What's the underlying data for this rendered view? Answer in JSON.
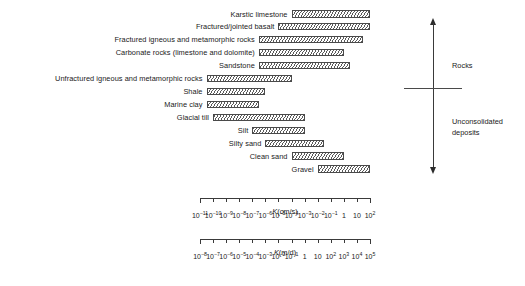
{
  "chart_data": {
    "type": "bar",
    "orientation": "horizontal",
    "scale": "log",
    "xlabel": "K (cm/s)",
    "xlabel_secondary": "K (m/d)",
    "ylabel": "",
    "grid": false,
    "legend": false,
    "axes": [
      {
        "name": "K (cm/s)",
        "unit": "cm/s",
        "exponent_min": -11,
        "exponent_max": 2,
        "ticks": [
          "10-11",
          "10-10",
          "10-9",
          "10-8",
          "10-7",
          "10-6",
          "10-5",
          "10-4",
          "10-3",
          "10-2",
          "10-1",
          "1",
          "10",
          "10 2"
        ],
        "tick_labels": [
          {
            "mantissa": "10",
            "exponent": "−11"
          },
          {
            "mantissa": "10",
            "exponent": "−10"
          },
          {
            "mantissa": "10",
            "exponent": "−9"
          },
          {
            "mantissa": "10",
            "exponent": "−8"
          },
          {
            "mantissa": "10",
            "exponent": "−7"
          },
          {
            "mantissa": "10",
            "exponent": "−6"
          },
          {
            "mantissa": "10",
            "exponent": "−5"
          },
          {
            "mantissa": "10",
            "exponent": "−4"
          },
          {
            "mantissa": "10",
            "exponent": "−3"
          },
          {
            "mantissa": "10",
            "exponent": "−2"
          },
          {
            "mantissa": "10",
            "exponent": "−1"
          },
          {
            "mantissa": "1",
            "exponent": ""
          },
          {
            "mantissa": "10",
            "exponent": ""
          },
          {
            "mantissa": "10",
            "exponent": "2"
          }
        ]
      },
      {
        "name": "K (m/d)",
        "unit": "m/d",
        "exponent_min": -8,
        "exponent_max": 5,
        "ticks": [
          "10-8",
          "10-7",
          "10-6",
          "10-5",
          "10-4",
          "10-3",
          "10-2",
          "10-1",
          "1",
          "10",
          "10 2",
          "10 3",
          "10 4",
          "10 5"
        ],
        "tick_labels": [
          {
            "mantissa": "10",
            "exponent": "−8"
          },
          {
            "mantissa": "10",
            "exponent": "−7"
          },
          {
            "mantissa": "10",
            "exponent": "−6"
          },
          {
            "mantissa": "10",
            "exponent": "−5"
          },
          {
            "mantissa": "10",
            "exponent": "−4"
          },
          {
            "mantissa": "10",
            "exponent": "−3"
          },
          {
            "mantissa": "10",
            "exponent": "−2"
          },
          {
            "mantissa": "10",
            "exponent": "−1"
          },
          {
            "mantissa": "1",
            "exponent": ""
          },
          {
            "mantissa": "10",
            "exponent": ""
          },
          {
            "mantissa": "10",
            "exponent": "2"
          },
          {
            "mantissa": "10",
            "exponent": "3"
          },
          {
            "mantissa": "10",
            "exponent": "4"
          },
          {
            "mantissa": "10",
            "exponent": "5"
          }
        ]
      }
    ],
    "categories": [
      "Karstic limestone",
      "Fractured/jointed basalt",
      "Fractured igneous and metamorphic rocks",
      "Carbonate rocks (limestone and dolomite)",
      "Sandstone",
      "Unfractured igneous and metamorphic rocks",
      "Shale",
      "Marine clay",
      "Glacial till",
      "Silt",
      "Silty sand",
      "Clean sand",
      "Gravel"
    ],
    "series": [
      {
        "name": "K range (cm/s), log10 bounds",
        "values": [
          [
            -4.0,
            2.0
          ],
          [
            -5.0,
            2.0
          ],
          [
            -6.5,
            1.5
          ],
          [
            -6.5,
            0.0
          ],
          [
            -6.5,
            0.5
          ],
          [
            -10.5,
            -4.0
          ],
          [
            -10.5,
            -6.0
          ],
          [
            -10.5,
            -6.5
          ],
          [
            -10.0,
            -3.0
          ],
          [
            -7.0,
            -3.0
          ],
          [
            -6.0,
            -1.5
          ],
          [
            -4.0,
            0.0
          ],
          [
            -2.0,
            2.0
          ]
        ]
      }
    ],
    "bars": [
      {
        "label": "Karstic limestone",
        "group": "rocks",
        "k_cms_min": 0.0001,
        "k_cms_max": 100,
        "log_min": -4.0,
        "log_max": 2.0
      },
      {
        "label": "Fractured/jointed basalt",
        "group": "rocks",
        "k_cms_min": 1e-05,
        "k_cms_max": 100,
        "log_min": -5.0,
        "log_max": 2.0
      },
      {
        "label": "Fractured igneous and metamorphic rocks",
        "group": "rocks",
        "k_cms_min": 3e-07,
        "k_cms_max": 30,
        "log_min": -6.5,
        "log_max": 1.5
      },
      {
        "label": "Carbonate rocks (limestone and dolomite)",
        "group": "rocks",
        "k_cms_min": 3e-07,
        "k_cms_max": 1,
        "log_min": -6.5,
        "log_max": 0.0
      },
      {
        "label": "Sandstone",
        "group": "rocks",
        "k_cms_min": 3e-07,
        "k_cms_max": 3,
        "log_min": -6.5,
        "log_max": 0.5
      },
      {
        "label": "Unfractured igneous and metamorphic rocks",
        "group": "rocks",
        "k_cms_min": 3e-11,
        "k_cms_max": 0.0001,
        "log_min": -10.5,
        "log_max": -4.0
      },
      {
        "label": "Shale",
        "group": "rocks",
        "k_cms_min": 3e-11,
        "k_cms_max": 1e-06,
        "log_min": -10.5,
        "log_max": -6.0
      },
      {
        "label": "Marine clay",
        "group": "unconsolidated",
        "k_cms_min": 3e-11,
        "k_cms_max": 3e-07,
        "log_min": -10.5,
        "log_max": -6.5
      },
      {
        "label": "Glacial till",
        "group": "unconsolidated",
        "k_cms_min": 1e-10,
        "k_cms_max": 0.001,
        "log_min": -10.0,
        "log_max": -3.0
      },
      {
        "label": "Silt",
        "group": "unconsolidated",
        "k_cms_min": 1e-07,
        "k_cms_max": 0.001,
        "log_min": -7.0,
        "log_max": -3.0
      },
      {
        "label": "Silty sand",
        "group": "unconsolidated",
        "k_cms_min": 1e-06,
        "k_cms_max": 0.03,
        "log_min": -6.0,
        "log_max": -1.5
      },
      {
        "label": "Clean sand",
        "group": "unconsolidated",
        "k_cms_min": 0.0001,
        "k_cms_max": 1,
        "log_min": -4.0,
        "log_max": 0.0
      },
      {
        "label": "Gravel",
        "group": "unconsolidated",
        "k_cms_min": 0.01,
        "k_cms_max": 100,
        "log_min": -2.0,
        "log_max": 2.0
      }
    ],
    "annotations": [
      {
        "name": "rocks",
        "text": "Rocks"
      },
      {
        "name": "unconsolidated-deposits",
        "text": "Unconsolidated\ndeposits"
      }
    ]
  },
  "groups": {
    "rocks_label": "Rocks",
    "unconsolidated_label_line1": "Unconsolidated",
    "unconsolidated_label_line2": "deposits"
  },
  "axis_captions": {
    "primary_symbol": "K",
    "primary_unit": "(cm/s)",
    "secondary_symbol": "K",
    "secondary_unit": "(m/d)"
  },
  "colors": {
    "background": "#ffffff",
    "text": "#1a1a1a",
    "line": "#3a3a3a",
    "bar_outline": "#4a4a4a",
    "bar_hatch": "#5a5a5a"
  }
}
